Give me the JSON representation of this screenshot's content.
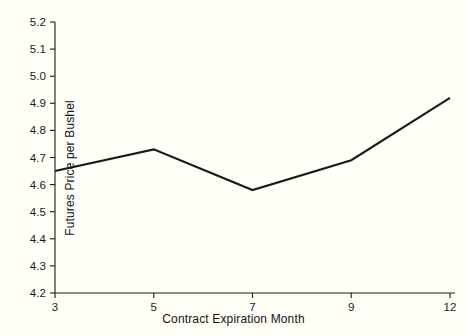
{
  "chart_data": {
    "type": "line",
    "title": "",
    "subtitle": "",
    "xlabel": "Contract Expiration Month",
    "ylabel": "Futures Price per Bushel",
    "x": [
      3,
      5,
      7,
      9,
      12
    ],
    "xtick_labels": [
      "3",
      "5",
      "7",
      "9",
      "12"
    ],
    "values": [
      4.65,
      4.73,
      4.58,
      4.69,
      4.92
    ],
    "series": [
      {
        "name": "Futures Price",
        "values": [
          4.65,
          4.73,
          4.58,
          4.69,
          4.92
        ]
      }
    ],
    "ylim": [
      4.2,
      5.2
    ],
    "ytick_labels": [
      "5.2",
      "5.1",
      "5.0",
      "4.9",
      "4.8",
      "4.7",
      "4.6",
      "4.5",
      "4.4",
      "4.3",
      "4.2"
    ],
    "ytick_values": [
      5.2,
      5.1,
      5.0,
      4.9,
      4.8,
      4.7,
      4.6,
      4.5,
      4.4,
      4.3,
      4.2
    ],
    "grid": false,
    "legend": false,
    "legend_position": "none",
    "line_color": "#1a1a1a",
    "background_color": "#fffef7",
    "axis_color": "#1a1a1a",
    "annotations": []
  }
}
